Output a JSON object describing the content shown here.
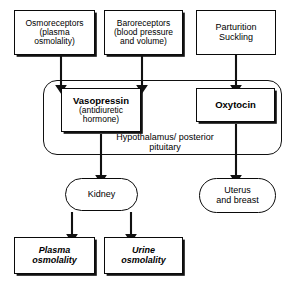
{
  "diagram": {
    "colors": {
      "stroke": "#111111",
      "background": "#ffffff",
      "text": "#000000"
    },
    "region": {
      "name": "hypothalamus-posterior-pituitary",
      "label_line1": "Hypothalamus/",
      "label_line2": "posterior pituitary"
    },
    "nodes": {
      "osmoreceptors": {
        "line1": "Osmoreceptors",
        "line2": "(plasma",
        "line3": "osmolality)"
      },
      "baroreceptors": {
        "line1": "Baroreceptors",
        "line2": "(blood pressure",
        "line3": "and volume)"
      },
      "parturition": {
        "line1": "Parturition",
        "line2": "Suckling"
      },
      "vasopressin": {
        "line1": "Vasopressin",
        "line2": "(antidiuretic",
        "line3": "hormone)"
      },
      "oxytocin": {
        "line1": "Oxytocin"
      },
      "kidney": {
        "line1": "Kidney"
      },
      "uterus_breast": {
        "line1": "Uterus",
        "line2": "and breast"
      },
      "plasma_osmolality": {
        "line1": "Plasma",
        "line2": "osmolality"
      },
      "urine_osmolality": {
        "line1": "Urine",
        "line2": "osmolality"
      }
    },
    "edges": [
      {
        "name": "osmoreceptors-to-vasopressin",
        "from": "osmoreceptors",
        "to": "vasopressin"
      },
      {
        "name": "baroreceptors-to-vasopressin",
        "from": "baroreceptors",
        "to": "vasopressin"
      },
      {
        "name": "parturition-to-oxytocin",
        "from": "parturition",
        "to": "oxytocin"
      },
      {
        "name": "vasopressin-to-kidney",
        "from": "vasopressin",
        "to": "kidney"
      },
      {
        "name": "oxytocin-to-uterus-and-breast",
        "from": "oxytocin",
        "to": "uterus_breast"
      },
      {
        "name": "kidney-to-plasma-osmolality",
        "from": "kidney",
        "to": "plasma_osmolality"
      },
      {
        "name": "kidney-to-urine-osmolality",
        "from": "kidney",
        "to": "urine_osmolality"
      }
    ]
  }
}
